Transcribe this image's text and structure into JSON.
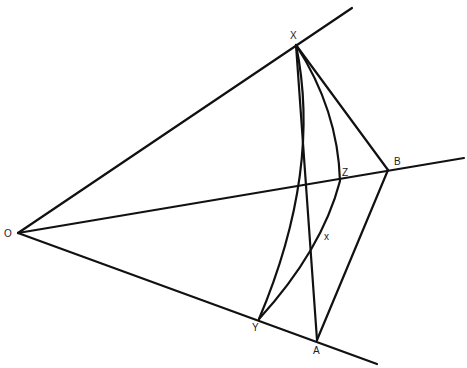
{
  "diagram": {
    "title": "",
    "colors": {
      "stroke": "#111111",
      "label": "#222222",
      "background": "#ffffff"
    },
    "points": {
      "O": {
        "label": "O",
        "x": 18,
        "y": 233
      },
      "X": {
        "label": "X",
        "x": 296,
        "y": 45
      },
      "B": {
        "label": "B",
        "x": 388,
        "y": 170
      },
      "A": {
        "label": "A",
        "x": 317,
        "y": 340
      },
      "Y": {
        "label": "Y",
        "x": 259,
        "y": 319
      },
      "Z": {
        "label": "Z",
        "x": 340,
        "y": 181
      },
      "x_mark": {
        "label": "x",
        "x": 326,
        "y": 238
      }
    },
    "labels": {
      "O": "O",
      "X": "X",
      "B": "B",
      "A": "A",
      "Y": "Y",
      "Z": "Z",
      "x": "x"
    },
    "rays": [
      {
        "name": "ray-OX",
        "from": "O",
        "to_end": [
          352,
          8
        ]
      },
      {
        "name": "ray-OB",
        "from": "O",
        "to_end": [
          464,
          158
        ]
      },
      {
        "name": "ray-OA",
        "from": "O",
        "to_end": [
          377,
          364
        ]
      }
    ],
    "segments": [
      {
        "name": "segment-XA",
        "from": "X",
        "to": "A"
      },
      {
        "name": "segment-XB",
        "from": "X",
        "to": "B"
      },
      {
        "name": "segment-BA",
        "from": "B",
        "to": "A"
      }
    ],
    "curves": [
      {
        "name": "arc-XY-inner",
        "from": "X",
        "to": "Y",
        "through": [
          312,
          150
        ]
      },
      {
        "name": "arc-XZY",
        "from": "X",
        "via": "Z",
        "to": "Y"
      }
    ]
  }
}
